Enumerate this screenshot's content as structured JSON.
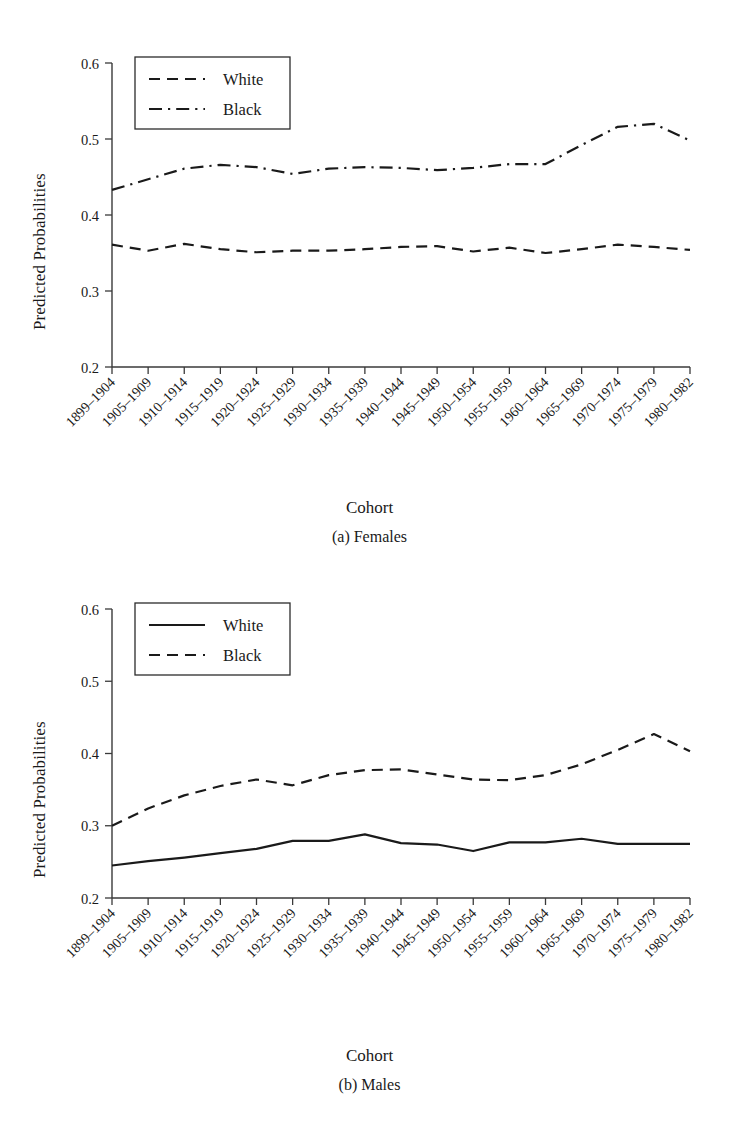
{
  "figure": {
    "yaxis_title": "Predicted Probabilities",
    "xaxis_title": "Cohort",
    "caption_a": "(a) Females",
    "caption_b": "(b) Males"
  },
  "chart_data": [
    {
      "type": "line",
      "title": "(a) Females",
      "xlabel": "Cohort",
      "ylabel": "Predicted Probabilities",
      "ylim": [
        0.2,
        0.6
      ],
      "yticks": [
        0.2,
        0.3,
        0.4,
        0.5,
        0.6
      ],
      "ytick_labels": [
        "0.2",
        "0.3",
        "0.4",
        "0.5",
        "0.6"
      ],
      "grid": false,
      "legend_position": "upper left",
      "categories": [
        "1899–1904",
        "1905–1909",
        "1910–1914",
        "1915–1919",
        "1920–1924",
        "1925–1929",
        "1930–1934",
        "1935–1939",
        "1940–1944",
        "1945–1949",
        "1950–1954",
        "1955–1959",
        "1960–1964",
        "1965–1969",
        "1970–1974",
        "1975–1979",
        "1980–1982"
      ],
      "series": [
        {
          "name": "White",
          "style": "dashed",
          "values": [
            0.361,
            0.353,
            0.362,
            0.355,
            0.351,
            0.353,
            0.353,
            0.355,
            0.358,
            0.359,
            0.352,
            0.357,
            0.35,
            0.355,
            0.361,
            0.358,
            0.354
          ]
        },
        {
          "name": "Black",
          "style": "dashdot",
          "values": [
            0.433,
            0.447,
            0.461,
            0.466,
            0.463,
            0.454,
            0.461,
            0.463,
            0.462,
            0.459,
            0.462,
            0.467,
            0.467,
            0.492,
            0.516,
            0.52,
            0.498
          ]
        }
      ]
    },
    {
      "type": "line",
      "title": "(b) Males",
      "xlabel": "Cohort",
      "ylabel": "Predicted Probabilities",
      "ylim": [
        0.2,
        0.6
      ],
      "yticks": [
        0.2,
        0.3,
        0.4,
        0.5,
        0.6
      ],
      "ytick_labels": [
        "0.2",
        "0.3",
        "0.4",
        "0.5",
        "0.6"
      ],
      "grid": false,
      "legend_position": "upper left",
      "categories": [
        "1899–1904",
        "1905–1909",
        "1910–1914",
        "1915–1919",
        "1920–1924",
        "1925–1929",
        "1930–1934",
        "1935–1939",
        "1940–1944",
        "1945–1949",
        "1950–1954",
        "1955–1959",
        "1960–1964",
        "1965–1969",
        "1970–1974",
        "1975–1979",
        "1980–1982"
      ],
      "series": [
        {
          "name": "White",
          "style": "solid",
          "values": [
            0.245,
            0.251,
            0.256,
            0.262,
            0.268,
            0.279,
            0.279,
            0.288,
            0.276,
            0.274,
            0.265,
            0.277,
            0.277,
            0.282,
            0.275,
            0.275,
            0.275
          ]
        },
        {
          "name": "Black",
          "style": "dashed",
          "values": [
            0.3,
            0.324,
            0.342,
            0.355,
            0.364,
            0.356,
            0.37,
            0.377,
            0.378,
            0.371,
            0.364,
            0.363,
            0.37,
            0.385,
            0.405,
            0.427,
            0.403
          ]
        }
      ]
    }
  ],
  "xtick_labels": [
    "1899–1904",
    "1905–1909",
    "1910–1914",
    "1915–1919",
    "1920–1924",
    "1925–1929",
    "1930–1934",
    "1935–1939",
    "1940–1944",
    "1945–1949",
    "1950–1954",
    "1955–1959",
    "1960–1964",
    "1965–1969",
    "1970–1974",
    "1975–1979",
    "1980–1982"
  ],
  "colors": {
    "line": "#1a1a1a",
    "axis": "#3a3a3a",
    "background": "#ffffff"
  }
}
